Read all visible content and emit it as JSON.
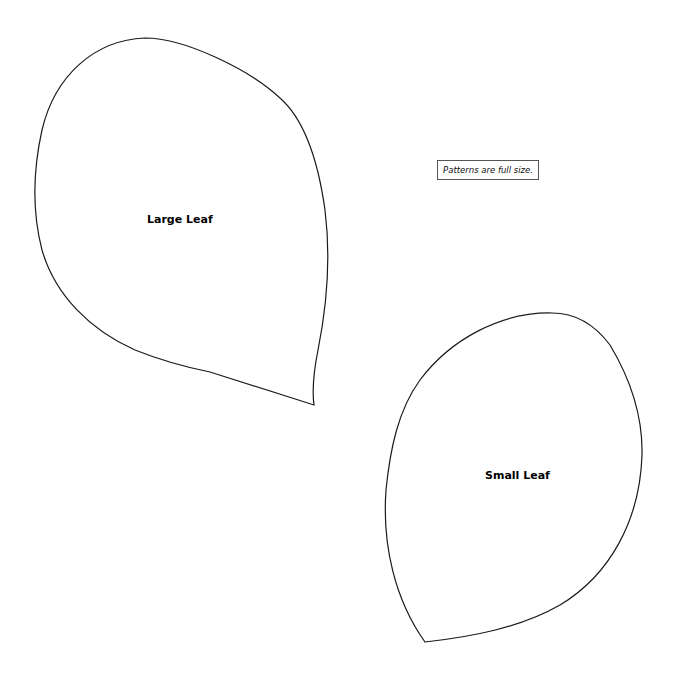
{
  "document": {
    "type": "sewing-pattern-sheet",
    "note": "Patterns are full size.",
    "patterns": [
      {
        "name": "large-leaf",
        "label": "Large Leaf"
      },
      {
        "name": "small-leaf",
        "label": "Small Leaf"
      }
    ],
    "colors": {
      "background": "#ffffff",
      "outline": "#1a1a1a",
      "text": "#000000"
    }
  }
}
